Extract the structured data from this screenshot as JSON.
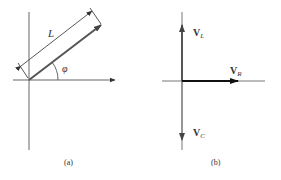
{
  "panels": [
    {
      "id": "a",
      "caption": "(a)",
      "labels": {
        "length": "L",
        "angle": "φ"
      }
    },
    {
      "id": "b",
      "caption": "(b)",
      "vectors": [
        {
          "name": "V",
          "sub": "L",
          "direction": "up"
        },
        {
          "name": "V",
          "sub": "R",
          "direction": "right"
        },
        {
          "name": "V",
          "sub": "C",
          "direction": "down"
        }
      ]
    }
  ],
  "colors": {
    "axis": "#555555",
    "vector": "#444444",
    "vector_r": "#111111"
  }
}
